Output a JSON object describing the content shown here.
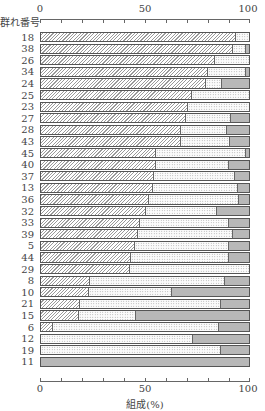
{
  "chart_data": {
    "type": "bar",
    "orientation": "horizontal",
    "stacked": true,
    "title": "",
    "ylabel": "群れ番号",
    "xlabel": "組成(%)",
    "xlim": [
      0,
      100
    ],
    "x_ticks": [
      "0",
      "50",
      "100"
    ],
    "x_minor_tick_step": 10,
    "grid": false,
    "legend": null,
    "series_patterns": [
      "diagonal-hatch",
      "dotted",
      "gray-solid"
    ],
    "categories": [
      "18",
      "38",
      "26",
      "34",
      "24",
      "25",
      "23",
      "27",
      "28",
      "43",
      "45",
      "40",
      "37",
      "13",
      "36",
      "32",
      "33",
      "39",
      "5",
      "44",
      "29",
      "8",
      "10",
      "21",
      "15",
      "6",
      "12",
      "19",
      "11"
    ],
    "series": [
      {
        "name": "hatched",
        "values": [
          93.5,
          92,
          83,
          80,
          79,
          72,
          70,
          69,
          67,
          67,
          55,
          55,
          54,
          53.5,
          51.5,
          50,
          47,
          46,
          44.5,
          43,
          42.5,
          23,
          22.5,
          18.5,
          18,
          5.5,
          0,
          0,
          0
        ]
      },
      {
        "name": "dotted",
        "values": [
          6.5,
          6,
          17,
          18,
          7.5,
          28,
          30,
          22,
          22,
          23.5,
          43,
          35,
          39,
          40.5,
          43,
          34,
          43,
          46,
          45.5,
          47,
          57.5,
          65,
          40,
          67.5,
          27,
          79.5,
          72.5,
          86,
          0
        ]
      },
      {
        "name": "gray",
        "values": [
          0,
          2,
          0,
          2,
          13.5,
          0,
          0,
          9,
          11,
          9.5,
          2,
          10,
          7,
          6,
          5.5,
          16,
          10,
          8,
          10,
          10,
          0,
          12,
          37.5,
          14,
          55,
          15,
          27.5,
          14,
          100
        ]
      }
    ]
  },
  "axis": {
    "top_ticks": [
      "0",
      "50",
      "100"
    ],
    "bottom_ticks": [
      "0",
      "50",
      "100"
    ],
    "y_title": "群れ番号",
    "x_title": "組成(%)"
  }
}
